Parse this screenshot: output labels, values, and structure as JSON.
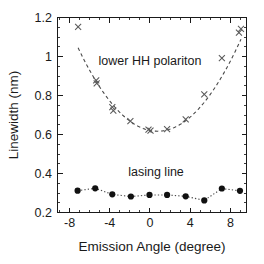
{
  "figure": {
    "background_color": "#ffffff",
    "axis_color": "#1a1a1a"
  },
  "chart_data": {
    "type": "scatter",
    "title": "",
    "xlabel": "Emission Angle (degree)",
    "ylabel": "Linewidth (nm)",
    "xlim": [
      -9.2,
      9.6
    ],
    "ylim": [
      0.2,
      1.2
    ],
    "xticks": [
      -8,
      -4,
      0,
      4,
      8
    ],
    "xtick_labels": [
      "-8",
      "-4",
      "0",
      "4",
      "8"
    ],
    "yticks": [
      0.2,
      0.4,
      0.6,
      0.8,
      1.0,
      1.2
    ],
    "ytick_labels": [
      "0.2",
      "0.4",
      "0.6",
      "0.8",
      "1",
      "1.2"
    ],
    "x_minor_tick_step": 1,
    "y_minor_tick_step": 0.05,
    "grid": false,
    "legend": "none",
    "frame": "box",
    "tick_direction": "in",
    "annotations": [
      {
        "text": "lower HH polariton",
        "x": 0.0,
        "y": 0.955,
        "name": "lower-hh-polariton-label"
      },
      {
        "text": "lasing line",
        "x": 0.6,
        "y": 0.385,
        "name": "lasing-line-label"
      }
    ],
    "series": [
      {
        "name": "lower HH polariton",
        "marker": "x",
        "marker_color": "#5a5a5a",
        "fit_style": "dashed",
        "fit_color": "#4a4a4a",
        "points": [
          {
            "x": -7.15,
            "y": 1.152
          },
          {
            "x": -5.35,
            "y": 0.878
          },
          {
            "x": -5.3,
            "y": 0.862
          },
          {
            "x": -3.75,
            "y": 0.74
          },
          {
            "x": -3.65,
            "y": 0.722
          },
          {
            "x": -1.95,
            "y": 0.668
          },
          {
            "x": -0.15,
            "y": 0.625
          },
          {
            "x": 0.05,
            "y": 0.62
          },
          {
            "x": 1.7,
            "y": 0.628
          },
          {
            "x": 3.55,
            "y": 0.678
          },
          {
            "x": 5.4,
            "y": 0.806
          },
          {
            "x": 7.15,
            "y": 0.992
          },
          {
            "x": 8.85,
            "y": 1.122
          },
          {
            "x": 9.05,
            "y": 1.142
          }
        ],
        "fit_type": "parabola",
        "fit_vertex_x": 0.75,
        "fit_vertex_y": 0.617,
        "fit_curvature": 0.00685
      },
      {
        "name": "lasing line",
        "marker": "o",
        "marker_color": "#111111",
        "fit_style": "dotted",
        "fit_color": "#4a4a4a",
        "points": [
          {
            "x": -7.2,
            "y": 0.312
          },
          {
            "x": -5.45,
            "y": 0.324
          },
          {
            "x": -3.75,
            "y": 0.293
          },
          {
            "x": -1.9,
            "y": 0.282
          },
          {
            "x": -0.05,
            "y": 0.29
          },
          {
            "x": 1.7,
            "y": 0.29
          },
          {
            "x": 3.55,
            "y": 0.283
          },
          {
            "x": 5.4,
            "y": 0.262
          },
          {
            "x": 7.15,
            "y": 0.323
          },
          {
            "x": 8.95,
            "y": 0.311
          }
        ]
      }
    ]
  }
}
